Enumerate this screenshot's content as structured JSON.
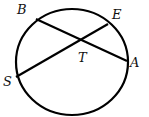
{
  "diagram": {
    "type": "circle-intersecting-chords",
    "circle": {
      "cx": 72,
      "cy": 62,
      "rx": 56,
      "ry": 53
    },
    "points": {
      "B": {
        "label": "B",
        "x": 36,
        "y": 19
      },
      "E": {
        "label": "E",
        "x": 108,
        "y": 24
      },
      "A": {
        "label": "A",
        "x": 127,
        "y": 61
      },
      "S": {
        "label": "S",
        "x": 16,
        "y": 77
      },
      "T": {
        "label": "T",
        "x": 80,
        "y": 41
      }
    },
    "chords": [
      {
        "from": "B",
        "to": "A"
      },
      {
        "from": "S",
        "to": "E"
      }
    ],
    "stroke_color": "#000000"
  }
}
